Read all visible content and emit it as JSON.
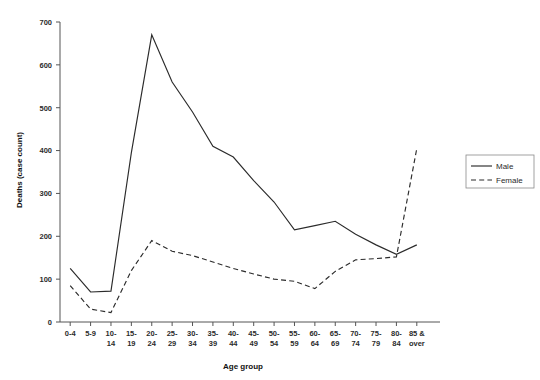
{
  "chart_data": {
    "type": "line",
    "title": "",
    "xlabel": "Age group",
    "ylabel": "Deaths (case count)",
    "ylim": [
      0,
      700
    ],
    "ytick_step": 100,
    "yticks": [
      0,
      100,
      200,
      300,
      400,
      500,
      600,
      700
    ],
    "grid": false,
    "legend_position": "right",
    "categories": [
      "0-4",
      "5-9",
      "10-\n14",
      "15-\n19",
      "20-\n24",
      "25-\n29",
      "30-\n34",
      "35-\n39",
      "40-\n44",
      "45-\n49",
      "50-\n54",
      "55-\n59",
      "60-\n64",
      "65-\n69",
      "70-\n74",
      "75-\n79",
      "80-\n84",
      "85 &\nover"
    ],
    "category_labels": [
      [
        "0-4",
        ""
      ],
      [
        "5-9",
        ""
      ],
      [
        "10-",
        "14"
      ],
      [
        "15-",
        "19"
      ],
      [
        "20-",
        "24"
      ],
      [
        "25-",
        "29"
      ],
      [
        "30-",
        "34"
      ],
      [
        "35-",
        "39"
      ],
      [
        "40-",
        "44"
      ],
      [
        "45-",
        "49"
      ],
      [
        "50-",
        "54"
      ],
      [
        "55-",
        "59"
      ],
      [
        "60-",
        "64"
      ],
      [
        "65-",
        "69"
      ],
      [
        "70-",
        "74"
      ],
      [
        "75-",
        "79"
      ],
      [
        "80-",
        "84"
      ],
      [
        "85 &",
        "over"
      ]
    ],
    "series": [
      {
        "name": "Male",
        "style": "solid",
        "color": "#2b2b2b",
        "values": [
          125,
          70,
          72,
          395,
          670,
          560,
          490,
          410,
          385,
          330,
          280,
          215,
          225,
          235,
          205,
          180,
          158,
          180
        ]
      },
      {
        "name": "Female",
        "style": "dashed",
        "color": "#2b2b2b",
        "values": [
          85,
          30,
          22,
          120,
          190,
          165,
          155,
          140,
          125,
          112,
          100,
          95,
          78,
          118,
          145,
          148,
          152,
          405
        ]
      }
    ]
  },
  "legend": {
    "entries": [
      {
        "label": "Male",
        "style": "solid"
      },
      {
        "label": "Female",
        "style": "dashed"
      }
    ]
  }
}
